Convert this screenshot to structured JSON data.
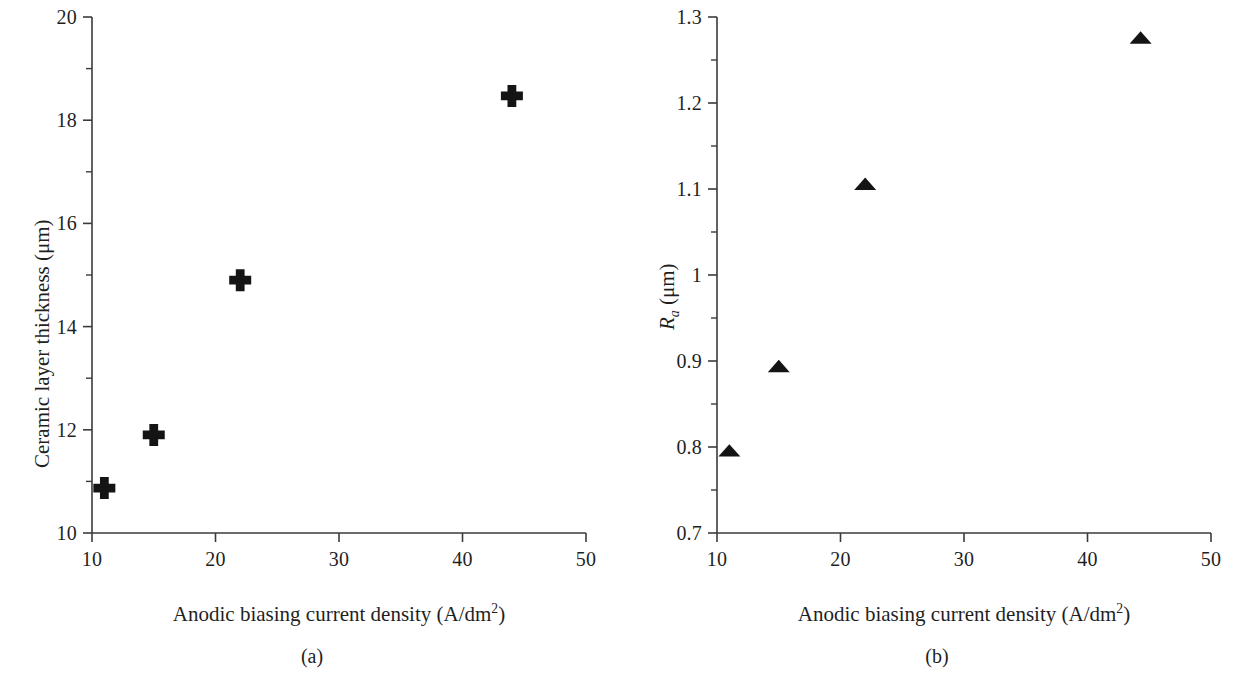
{
  "figure": {
    "background": "#ffffff",
    "ink_color": "#1f1f1f",
    "marker_color": "#141414",
    "panels": [
      {
        "caption": "(a)",
        "marker_symbol": "plus",
        "x_title_main": "Anodic biasing current density (A/dm",
        "x_title_sup": "2",
        "x_title_tail": ")",
        "y_title": "Ceramic layer thickness (μm)",
        "x_ticks": [
          "10",
          "20",
          "30",
          "40",
          "50"
        ],
        "y_ticks": [
          "10",
          "12",
          "14",
          "16",
          "18",
          "20"
        ]
      },
      {
        "caption": "(b)",
        "marker_symbol": "triangle",
        "x_title_main": "Anodic biasing current density (A/dm",
        "x_title_sup": "2",
        "x_title_tail": ")",
        "y_title_sym": "R",
        "y_title_sub": "a",
        "y_title_tail": " (μm)",
        "x_ticks": [
          "10",
          "20",
          "30",
          "40",
          "50"
        ],
        "y_ticks": [
          "0.7",
          "0.8",
          "0.9",
          "1",
          "1.1",
          "1.2",
          "1.3"
        ]
      }
    ]
  },
  "chart_data": [
    {
      "type": "scatter",
      "panel": "(a)",
      "title": "",
      "xlabel": "Anodic biasing current density (A/dm2)",
      "ylabel": "Ceramic layer thickness (μm)",
      "xlim": [
        10,
        50
      ],
      "ylim": [
        10,
        20
      ],
      "xticks": [
        10,
        20,
        30,
        40,
        50
      ],
      "yticks": [
        10,
        12,
        14,
        16,
        18,
        20
      ],
      "xminor": [
        15,
        25,
        35,
        45
      ],
      "yminor": [
        11,
        13,
        15,
        17,
        19
      ],
      "grid": false,
      "legend": false,
      "marker": "plus",
      "marker_color": "#141414",
      "series": [
        {
          "name": "Ceramic layer thickness",
          "x": [
            11,
            15,
            22,
            44
          ],
          "y": [
            10.87,
            11.9,
            14.9,
            18.47
          ]
        }
      ]
    },
    {
      "type": "scatter",
      "panel": "(b)",
      "title": "",
      "xlabel": "Anodic biasing current density (A/dm2)",
      "ylabel": "Ra (μm)",
      "xlim": [
        10,
        50
      ],
      "ylim": [
        0.7,
        1.3
      ],
      "xticks": [
        10,
        20,
        30,
        40,
        50
      ],
      "yticks": [
        0.7,
        0.8,
        0.9,
        1,
        1.1,
        1.2,
        1.3
      ],
      "xminor": [
        15,
        25,
        35,
        45
      ],
      "yminor": [
        0.75,
        0.85,
        0.95,
        1.05,
        1.15,
        1.25
      ],
      "grid": false,
      "legend": false,
      "marker": "triangle",
      "marker_color": "#141414",
      "series": [
        {
          "name": "Ra",
          "x": [
            11,
            15,
            22,
            44.3
          ],
          "y": [
            0.795,
            0.893,
            1.105,
            1.275
          ]
        }
      ]
    }
  ]
}
